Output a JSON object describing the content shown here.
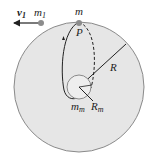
{
  "diagram": {
    "labels": {
      "velocity": "v",
      "velocity_sub": "1",
      "mass1": "m",
      "mass1_sub": "1",
      "mass": "m",
      "point": "P",
      "radius": "R",
      "moon_mass": "m",
      "moon_mass_sub": "m",
      "moon_radius": "R",
      "moon_radius_sub": "m"
    },
    "colors": {
      "large_circle_fill": "#e6e6e6",
      "large_circle_stroke": "#8a8a8a",
      "moon_fill": "#eeeeee",
      "line": "#222222",
      "particle": "#8c8c8c"
    }
  }
}
